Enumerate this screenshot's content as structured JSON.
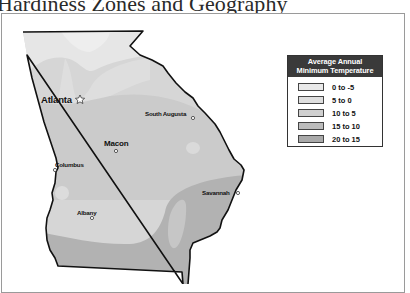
{
  "page": {
    "title": "Hardiness Zones and Geography"
  },
  "map": {
    "region": "Georgia",
    "cities": [
      {
        "name": "Atlanta",
        "marker": "star",
        "capital": true
      },
      {
        "name": "South Augusta",
        "marker": "circle"
      },
      {
        "name": "Macon",
        "marker": "circle"
      },
      {
        "name": "Columbus",
        "marker": "circle"
      },
      {
        "name": "Savannah",
        "marker": "circle"
      },
      {
        "name": "Albany",
        "marker": "circle"
      }
    ]
  },
  "legend": {
    "title_line1": "Average Annual",
    "title_line2": "Minimum Temperature",
    "items": [
      {
        "label": "0 to -5",
        "color": "#e9e9e9"
      },
      {
        "label": "5 to 0",
        "color": "#dedede"
      },
      {
        "label": "10 to 5",
        "color": "#cfcfcf"
      },
      {
        "label": "15 to 10",
        "color": "#bcbcbc"
      },
      {
        "label": "20 to 15",
        "color": "#a9a9a9"
      }
    ]
  }
}
